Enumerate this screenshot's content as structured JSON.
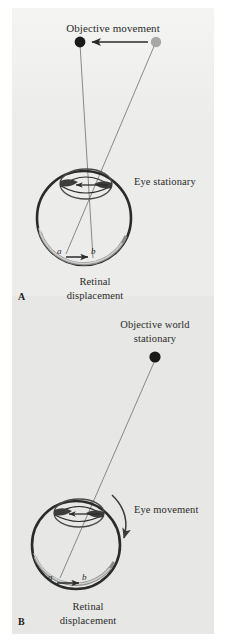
{
  "figure": {
    "type": "scientific-diagram",
    "background_color": "#ececea",
    "ink_color": "#2b2b2b",
    "page_color": "#ffffff"
  },
  "panel_a": {
    "letter": "A",
    "title_top": "Objective movement",
    "eye_label": "Eye stationary",
    "caption_line1": "Retinal",
    "caption_line2": "displacement",
    "retina_point_start": "a",
    "retina_point_end": "b",
    "target_start_color": "#a8a8a8",
    "target_end_color": "#1a1a1a",
    "motion_direction": "leftward"
  },
  "panel_b": {
    "letter": "B",
    "title_top_line1": "Objective world",
    "title_top_line2": "stationary",
    "eye_label": "Eye movement",
    "caption_line1": "Retinal",
    "caption_line2": "displacement",
    "retina_point_start": "a",
    "retina_point_end": "b",
    "target_color": "#1a1a1a",
    "motion_direction": "clockwise"
  }
}
